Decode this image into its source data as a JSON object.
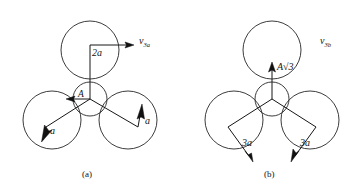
{
  "figure": {
    "background_color": "#ffffff",
    "stroke_color": "#262626",
    "text_color": "#141414",
    "panels": [
      {
        "id": "a",
        "caption": "(a)",
        "vertex_label": "A",
        "velocity_label_base": "v",
        "velocity_label_sub": "3a",
        "top_vector_label": "2a",
        "left_vector_label": "a",
        "right_vector_label": "a",
        "circles": {
          "central_radius": 16,
          "outer_radius": 28,
          "center": [
            90,
            96
          ],
          "top_circle_center": [
            90,
            52
          ],
          "left_circle_center": [
            52,
            118
          ],
          "right_circle_center": [
            128,
            118
          ]
        }
      },
      {
        "id": "b",
        "caption": "(b)",
        "vertex_label": "A",
        "radical_label": "√3",
        "velocity_label_base": "v",
        "velocity_label_sub": "3b",
        "top_vector_label": "A√3",
        "left_vector_label": "3a",
        "right_vector_label": "3a",
        "circles": {
          "central_radius": 16,
          "outer_radius": 28,
          "center": [
            272,
            96
          ],
          "top_circle_center": [
            272,
            52
          ],
          "left_circle_center": [
            234,
            118
          ],
          "right_circle_center": [
            310,
            118
          ]
        }
      }
    ]
  }
}
